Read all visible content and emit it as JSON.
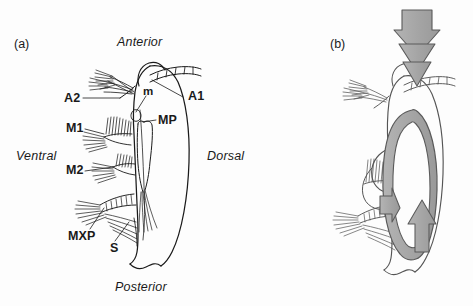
{
  "figure": {
    "background_color": "#fdfdfd",
    "ink_color": "#1a1a1a",
    "arrow_fill": "#a8a8a8",
    "arrow_stroke": "#4a4a4a"
  },
  "panels": [
    {
      "id": "a",
      "label": "(a)",
      "label_x": 14,
      "label_y": 38,
      "description": "Labelled lateral view of crustacean head appendages and body outline"
    },
    {
      "id": "b",
      "label": "(b)",
      "label_x": 330,
      "label_y": 38,
      "description": "Same animal with grey flow arrows showing feeding water current"
    }
  ],
  "orientation_labels": [
    {
      "text": "Anterior",
      "x": 117,
      "y": 36,
      "style": "italic"
    },
    {
      "text": "Posterior",
      "x": 115,
      "y": 281,
      "style": "italic"
    },
    {
      "text": "Ventral",
      "x": 16,
      "y": 150,
      "style": "italic"
    },
    {
      "text": "Dorsal",
      "x": 207,
      "y": 150,
      "style": "italic"
    }
  ],
  "anatomy_labels": [
    {
      "text": "A1",
      "x": 188,
      "y": 90,
      "name": "antenna-1",
      "leader": [
        183,
        97,
        152,
        80
      ]
    },
    {
      "text": "A2",
      "x": 64,
      "y": 92,
      "name": "antenna-2",
      "leader": [
        83,
        98,
        120,
        98
      ]
    },
    {
      "text": "m",
      "x": 143,
      "y": 86,
      "name": "mouth",
      "leader": [
        146,
        96,
        136,
        112
      ]
    },
    {
      "text": "MP",
      "x": 158,
      "y": 114,
      "name": "maxilliped",
      "leader": [
        156,
        120,
        142,
        122
      ]
    },
    {
      "text": "M1",
      "x": 66,
      "y": 122,
      "name": "maxilla-1",
      "leader": [
        85,
        129,
        104,
        134
      ]
    },
    {
      "text": "M2",
      "x": 66,
      "y": 164,
      "name": "maxilla-2",
      "leader": [
        85,
        171,
        113,
        167
      ]
    },
    {
      "text": "MXP",
      "x": 68,
      "y": 230,
      "name": "maxilliped-MXP",
      "leader": [
        90,
        229,
        104,
        208
      ]
    },
    {
      "text": "S",
      "x": 110,
      "y": 242,
      "name": "seta",
      "leader": [
        115,
        241,
        129,
        222
      ]
    }
  ],
  "flow_arrows": [
    {
      "name": "incoming-current-arrow",
      "direction": "down",
      "position": "top-center",
      "color": "#a8a8a8"
    },
    {
      "name": "circulation-loop-arrow",
      "direction": "loop",
      "position": "body-center",
      "color": "#a8a8a8"
    }
  ]
}
